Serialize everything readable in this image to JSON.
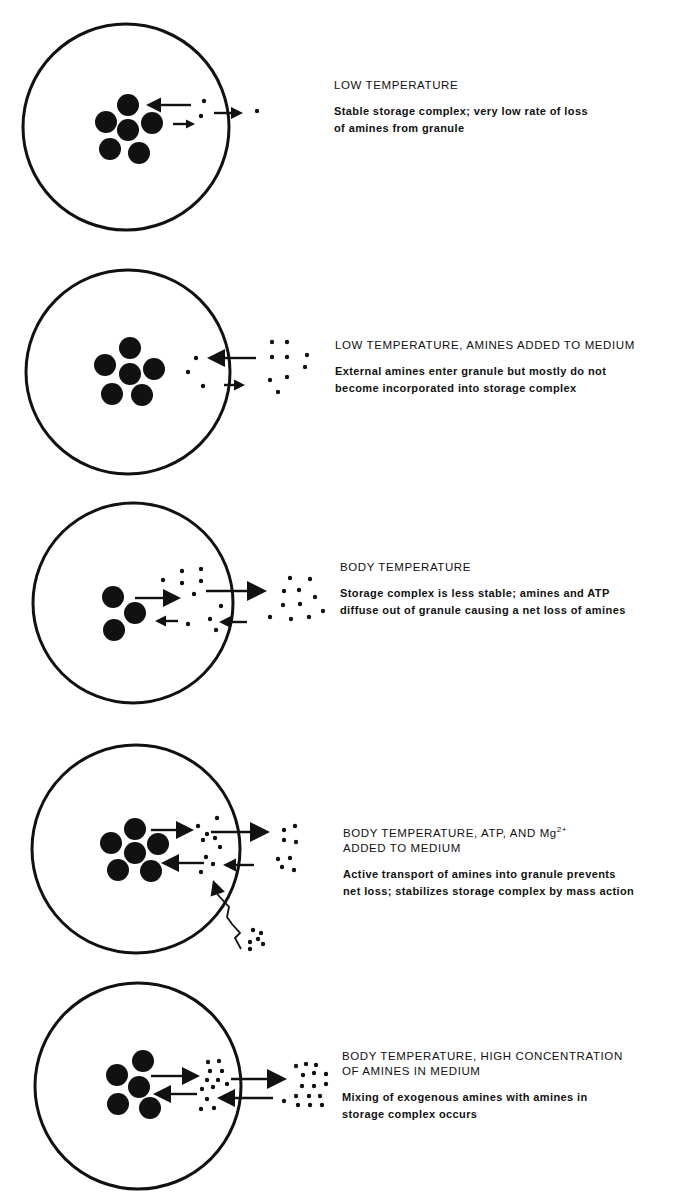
{
  "figure": {
    "width": 679,
    "height": 1204,
    "ink_color": "#111111",
    "background": "#ffffff"
  },
  "panels": [
    {
      "id": "low-temperature",
      "heading_lines": [
        "LOW TEMPERATURE"
      ],
      "description_lines": [
        "Stable storage complex; very low rate of loss",
        "of amines from granule"
      ],
      "text_pos": [
        334,
        78
      ],
      "granule": {
        "cx": 126,
        "cy": 127,
        "r": 103
      },
      "storage_spheres": [
        [
          128,
          105
        ],
        [
          106,
          122
        ],
        [
          128,
          130
        ],
        [
          152,
          123
        ],
        [
          110,
          149
        ],
        [
          139,
          153
        ]
      ],
      "sphere_r": 11,
      "dots": [
        [
          204,
          101
        ],
        [
          201,
          116
        ],
        [
          257,
          111
        ]
      ],
      "arrows": [
        {
          "from": [
            191,
            105
          ],
          "to": [
            146,
            105
          ],
          "head": 15
        },
        {
          "from": [
            173,
            124
          ],
          "to": [
            195,
            124
          ],
          "head": 9
        },
        {
          "from": [
            214,
            113
          ],
          "to": [
            243,
            113
          ],
          "head": 12
        }
      ],
      "wavy": []
    },
    {
      "id": "low-temperature-amines-added",
      "heading_lines": [
        "LOW TEMPERATURE, AMINES ADDED TO MEDIUM"
      ],
      "description_lines": [
        "External amines enter granule but mostly do not",
        "become incorporated into storage complex"
      ],
      "text_pos": [
        335,
        338
      ],
      "granule": {
        "cx": 128,
        "cy": 372,
        "r": 102
      },
      "storage_spheres": [
        [
          130,
          348
        ],
        [
          105,
          365
        ],
        [
          130,
          374
        ],
        [
          154,
          369
        ],
        [
          112,
          394
        ],
        [
          142,
          395
        ]
      ],
      "sphere_r": 11,
      "dots": [
        [
          196,
          358
        ],
        [
          188,
          372
        ],
        [
          203,
          386
        ],
        [
          272,
          342
        ],
        [
          287,
          342
        ],
        [
          272,
          357
        ],
        [
          287,
          357
        ],
        [
          307,
          355
        ],
        [
          305,
          367
        ],
        [
          270,
          380
        ],
        [
          287,
          377
        ],
        [
          278,
          392
        ]
      ],
      "arrows": [
        {
          "from": [
            256,
            358
          ],
          "to": [
            207,
            358
          ],
          "head": 18
        },
        {
          "from": [
            224,
            385
          ],
          "to": [
            245,
            385
          ],
          "head": 11
        }
      ],
      "wavy": []
    },
    {
      "id": "body-temperature",
      "heading_lines": [
        "BODY TEMPERATURE"
      ],
      "description_lines": [
        "Storage complex is less stable; amines and ATP",
        "diffuse out of granule  causing a net loss of amines"
      ],
      "text_pos": [
        340,
        560
      ],
      "granule": {
        "cx": 133,
        "cy": 603,
        "r": 100
      },
      "storage_spheres": [
        [
          113,
          597
        ],
        [
          135,
          613
        ],
        [
          114,
          630
        ]
      ],
      "sphere_r": 11,
      "dots": [
        [
          163,
          580
        ],
        [
          182,
          571
        ],
        [
          201,
          569
        ],
        [
          182,
          583
        ],
        [
          201,
          581
        ],
        [
          194,
          594
        ],
        [
          221,
          606
        ],
        [
          210,
          619
        ],
        [
          216,
          630
        ],
        [
          188,
          624
        ],
        [
          290,
          578
        ],
        [
          310,
          579
        ],
        [
          284,
          591
        ],
        [
          299,
          590
        ],
        [
          315,
          597
        ],
        [
          283,
          605
        ],
        [
          300,
          604
        ],
        [
          270,
          617
        ],
        [
          291,
          619
        ],
        [
          309,
          617
        ],
        [
          323,
          611
        ]
      ],
      "arrows": [
        {
          "from": [
            135,
            598
          ],
          "to": [
            181,
            598
          ],
          "head": 18
        },
        {
          "from": [
            206,
            591
          ],
          "to": [
            267,
            591
          ],
          "head": 20
        },
        {
          "from": [
            178,
            621
          ],
          "to": [
            155,
            621
          ],
          "head": 11
        },
        {
          "from": [
            247,
            622
          ],
          "to": [
            219,
            622
          ],
          "head": 12
        }
      ],
      "wavy": []
    },
    {
      "id": "body-temperature-atp-mg",
      "heading_lines": [
        "BODY TEMPERATURE, ATP, AND Mg",
        "ADDED TO MEDIUM"
      ],
      "heading_superscript": "2+",
      "description_lines": [
        "Active transport of amines into granule  prevents",
        "net loss; stabilizes storage complex by mass action"
      ],
      "text_pos": [
        343,
        822
      ],
      "granule": {
        "cx": 136,
        "cy": 849,
        "r": 104
      },
      "storage_spheres": [
        [
          135,
          829
        ],
        [
          111,
          843
        ],
        [
          135,
          853
        ],
        [
          158,
          844
        ],
        [
          118,
          870
        ],
        [
          151,
          871
        ]
      ],
      "sphere_r": 11,
      "dots": [
        [
          198,
          826
        ],
        [
          217,
          818
        ],
        [
          207,
          834
        ],
        [
          203,
          840
        ],
        [
          215,
          838
        ],
        [
          220,
          847
        ],
        [
          206,
          857
        ],
        [
          213,
          864
        ],
        [
          201,
          872
        ],
        [
          284,
          830
        ],
        [
          295,
          826
        ],
        [
          284,
          840
        ],
        [
          296,
          842
        ],
        [
          278,
          859
        ],
        [
          290,
          858
        ],
        [
          282,
          867
        ],
        [
          294,
          870
        ],
        [
          253,
          930
        ],
        [
          261,
          933
        ],
        [
          250,
          942
        ],
        [
          258,
          939
        ],
        [
          263,
          944
        ],
        [
          250,
          949
        ]
      ],
      "arrows": [
        {
          "from": [
            151,
            830
          ],
          "to": [
            194,
            830
          ],
          "head": 18
        },
        {
          "from": [
            211,
            832
          ],
          "to": [
            270,
            832
          ],
          "head": 20
        },
        {
          "from": [
            204,
            863
          ],
          "to": [
            161,
            863
          ],
          "head": 18
        },
        {
          "from": [
            254,
            865
          ],
          "to": [
            223,
            865
          ],
          "head": 13
        }
      ],
      "wavy": [
        {
          "points": [
            [
              241,
              949
            ],
            [
              235,
              938
            ],
            [
              240,
              933
            ],
            [
              232,
              924
            ],
            [
              227,
              917
            ],
            [
              229,
              907
            ],
            [
              218,
              895
            ]
          ],
          "head_at": [
            213,
            880
          ]
        }
      ]
    },
    {
      "id": "body-temperature-high-amines",
      "heading_lines": [
        "BODY TEMPERATURE, HIGH CONCENTRATION",
        "OF AMINES IN MEDIUM"
      ],
      "description_lines": [
        "Mixing of exogenous amines with amines in",
        "storage complex occurs"
      ],
      "text_pos": [
        342,
        1049
      ],
      "granule": {
        "cx": 138,
        "cy": 1086,
        "r": 103
      },
      "storage_spheres": [
        [
          143,
          1061
        ],
        [
          117,
          1075
        ],
        [
          139,
          1087
        ],
        [
          118,
          1104
        ],
        [
          150,
          1108
        ]
      ],
      "sphere_r": 11,
      "dots": [
        [
          208,
          1062
        ],
        [
          219,
          1061
        ],
        [
          210,
          1071
        ],
        [
          222,
          1071
        ],
        [
          207,
          1080
        ],
        [
          218,
          1080
        ],
        [
          202,
          1089
        ],
        [
          213,
          1087
        ],
        [
          227,
          1084
        ],
        [
          207,
          1099
        ],
        [
          201,
          1109
        ],
        [
          214,
          1108
        ],
        [
          296,
          1066
        ],
        [
          306,
          1064
        ],
        [
          316,
          1065
        ],
        [
          303,
          1075
        ],
        [
          314,
          1073
        ],
        [
          326,
          1074
        ],
        [
          302,
          1086
        ],
        [
          314,
          1086
        ],
        [
          326,
          1084
        ],
        [
          296,
          1096
        ],
        [
          309,
          1096
        ],
        [
          320,
          1096
        ],
        [
          284,
          1101
        ],
        [
          298,
          1105
        ],
        [
          310,
          1105
        ],
        [
          322,
          1105
        ]
      ],
      "arrows": [
        {
          "from": [
            151,
            1076
          ],
          "to": [
            200,
            1076
          ],
          "head": 18
        },
        {
          "from": [
            231,
            1079
          ],
          "to": [
            287,
            1079
          ],
          "head": 20
        },
        {
          "from": [
            197,
            1094
          ],
          "to": [
            153,
            1094
          ],
          "head": 18
        },
        {
          "from": [
            273,
            1098
          ],
          "to": [
            217,
            1098
          ],
          "head": 18
        }
      ],
      "wavy": []
    }
  ]
}
